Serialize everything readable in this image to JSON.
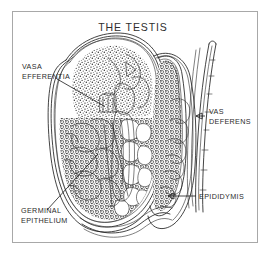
{
  "figure": {
    "title": "THE TESTIS",
    "domain_subject": "anatomical diagram of the testis",
    "background_color": "#ffffff",
    "frame_color": "#a8a8a8",
    "ink_color": "#222222",
    "text_color": "#2b2b2b",
    "labels": [
      {
        "id": "vasa-efferentia",
        "lines": [
          "VASA",
          "EFFERENTIA"
        ],
        "line1": "VASA",
        "line2": "EFFERENTIA",
        "position": "upper-left",
        "leader_direction": "up-right"
      },
      {
        "id": "vas-deferens",
        "lines": [
          "VAS",
          "DEFERENS"
        ],
        "line1": "VAS",
        "line2": "DEFERENS",
        "position": "right",
        "leader_direction": "left"
      },
      {
        "id": "epididymis",
        "lines": [
          "EPIDIDYMIS"
        ],
        "line1": "EPIDIDYMIS",
        "position": "lower-right",
        "leader_direction": "left"
      },
      {
        "id": "germinal-epithelium",
        "lines": [
          "GERMINAL",
          "EPITHELIUM"
        ],
        "line1": "GERMINAL",
        "line2": "EPITHELIUM",
        "position": "lower-left",
        "leader_direction": "up-right"
      }
    ]
  }
}
